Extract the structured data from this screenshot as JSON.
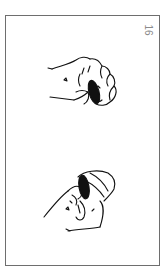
{
  "page": {
    "number": "16",
    "border_color": "#6e6e6e",
    "background": "#ffffff"
  },
  "illustrations": [
    {
      "id": "hand-top",
      "description": "fist holding a coin between fingers",
      "icon": "hand-with-coin-icon"
    },
    {
      "id": "hand-bottom",
      "description": "hand pinching a coin between thumb and fingers",
      "icon": "hand-with-coin-icon"
    }
  ]
}
